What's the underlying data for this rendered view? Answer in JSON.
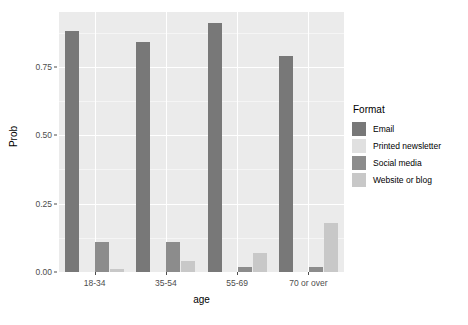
{
  "chart_data": {
    "type": "bar",
    "title": "",
    "subtitle": "",
    "xlabel": "age",
    "ylabel": "Prob",
    "categories": [
      "18-34",
      "35-54",
      "55-69",
      "70 or over"
    ],
    "series": [
      {
        "name": "Email",
        "values": [
          0.88,
          0.84,
          0.91,
          0.79
        ],
        "color": "#787878"
      },
      {
        "name": "Printed newsletter",
        "values": [
          0.0,
          0.0,
          0.0,
          0.0
        ],
        "color": "#e0e0e0"
      },
      {
        "name": "Social media",
        "values": [
          0.11,
          0.11,
          0.02,
          0.02
        ],
        "color": "#8c8c8c"
      },
      {
        "name": "Website or blog",
        "values": [
          0.01,
          0.04,
          0.07,
          0.18
        ],
        "color": "#c8c8c8"
      }
    ],
    "ylim": [
      0,
      0.95
    ],
    "yticks": [
      "0.00",
      "0.25",
      "0.50",
      "0.75"
    ],
    "ytick_values": [
      0.0,
      0.25,
      0.5,
      0.75
    ],
    "grid": true,
    "legend": {
      "title": "Format",
      "position": "right"
    },
    "panel_background": "#ebebeb",
    "grid_color": "#ffffff"
  }
}
